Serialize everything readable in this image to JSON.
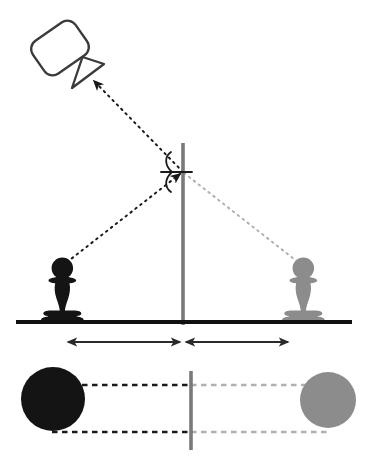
{
  "figure": {
    "background_color": "#ffffff"
  },
  "colors": {
    "object_black": "#141414",
    "image_gray": "#8c8c8c",
    "mirror_gray": "#7a7a7a",
    "ray_real": "#1a1a1a",
    "ray_virtual": "#b0b0b0",
    "ground_black": "#111111",
    "outline": "#3a3a3a"
  },
  "panels": [
    {
      "id": "side-view",
      "name": "side-view-panel",
      "label": "Side view",
      "elements": {
        "observer": {
          "name": "camera-observer-icon",
          "label": "Observer camera",
          "body": {
            "cx": 60,
            "cy": 48,
            "w": 52,
            "h": 40,
            "rotation_deg": -35,
            "corner_radius": 10
          },
          "lens_cone": {
            "apex_x": 72,
            "apex_y": 88,
            "p2_x": 104,
            "p2_y": 64,
            "p3_x": 82,
            "p3_y": 57
          },
          "stroke_color": "#3a3a3a",
          "stroke_width": 2.2,
          "fill": "#ffffff"
        },
        "incident_ray": {
          "name": "incident-ray",
          "label": "Incident ray to observer",
          "from": {
            "x": 183,
            "y": 172
          },
          "to": {
            "x": 94,
            "y": 81
          },
          "style": "dashed",
          "color": "#1a1a1a",
          "arrow_at": "to"
        },
        "object_ray": {
          "name": "object-ray",
          "label": "Ray from object to mirror",
          "from": {
            "x": 62,
            "y": 265
          },
          "to": {
            "x": 183,
            "y": 172
          },
          "style": "dashed",
          "color": "#1a1a1a",
          "arrow_at": "to"
        },
        "virtual_ray": {
          "name": "virtual-ray",
          "label": "Virtual ray to image",
          "from": {
            "x": 183,
            "y": 172
          },
          "to": {
            "x": 303,
            "y": 266
          },
          "style": "dashed",
          "color": "#b0b0b0",
          "arrow_at": "none"
        },
        "mirror": {
          "name": "mirror-line",
          "label": "Plane mirror",
          "x": 183,
          "y1": 143,
          "y2": 325,
          "color": "#7a7a7a",
          "width": 3.4
        },
        "normal": {
          "name": "normal-line",
          "label": "Normal to mirror surface",
          "x1": 161,
          "x2": 192,
          "y": 172,
          "color": "#1a1a1a",
          "width": 1.8
        },
        "angle_incidence": {
          "name": "angle-of-incidence-arc",
          "label": "Angle of incidence",
          "value": ""
        },
        "angle_reflection": {
          "name": "angle-of-reflection-arc",
          "label": "Angle of reflection",
          "value": ""
        },
        "object_pawn": {
          "name": "object-pawn",
          "label": "Real pawn (object)",
          "cx": 62,
          "base_y": 322,
          "color": "#141414"
        },
        "image_pawn": {
          "name": "image-pawn",
          "label": "Virtual pawn (image)",
          "cx": 303,
          "base_y": 322,
          "color": "#8c8c8c"
        },
        "ground": {
          "name": "ground-line",
          "label": "Ground line",
          "x1": 16,
          "x2": 352,
          "y": 322,
          "color": "#111111",
          "width": 4
        },
        "distance_object": {
          "name": "object-distance-arrow",
          "label": "Object distance to mirror",
          "x1": 67,
          "x2": 181,
          "y": 342,
          "color": "#2a2a2a"
        },
        "distance_image": {
          "name": "image-distance-arrow",
          "label": "Image distance from mirror",
          "x1": 185,
          "x2": 289,
          "y": 342,
          "color": "#2a2a2a"
        }
      }
    },
    {
      "id": "top-view",
      "name": "top-view-panel",
      "label": "Top view",
      "elements": {
        "object_disc": {
          "name": "object-disc",
          "label": "Real pawn seen from above",
          "cx": 53,
          "cy": 399,
          "r": 32,
          "color": "#141414"
        },
        "image_disc": {
          "name": "image-disc",
          "label": "Virtual image seen from above",
          "cx": 328,
          "cy": 400,
          "r": 28,
          "color": "#8c8c8c"
        },
        "mirror": {
          "name": "mirror-line-top",
          "label": "Plane mirror, top view",
          "x": 191,
          "y1": 371,
          "y2": 450,
          "color": "#7a7a7a",
          "width": 3.4
        },
        "upper_real_line": {
          "name": "upper-real-sightline",
          "label": "Upper sight line to mirror",
          "x1": 54,
          "x2": 191,
          "y": 385,
          "color": "#1a1a1a",
          "style": "dashed"
        },
        "upper_virtual_line": {
          "name": "upper-virtual-sightline",
          "label": "Upper virtual line to image",
          "x1": 191,
          "x2": 330,
          "y": 385,
          "color": "#b0b0b0",
          "style": "dashed"
        },
        "lower_real_line": {
          "name": "lower-real-sightline",
          "label": "Lower sight line to mirror",
          "x1": 54,
          "x2": 191,
          "y": 432,
          "color": "#1a1a1a",
          "style": "dashed"
        },
        "lower_virtual_line": {
          "name": "lower-virtual-sightline",
          "label": "Lower virtual line to image",
          "x1": 191,
          "x2": 330,
          "y": 432,
          "color": "#b0b0b0",
          "style": "dashed"
        }
      }
    }
  ]
}
